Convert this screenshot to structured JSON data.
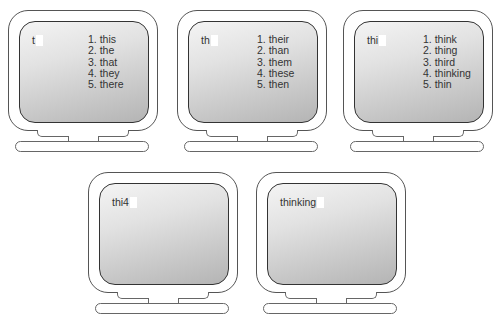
{
  "monitors": [
    {
      "typed": "t",
      "suggestions": [
        "1. this",
        "2. the",
        "3. that",
        "4. they",
        "5. there"
      ]
    },
    {
      "typed": "th",
      "suggestions": [
        "1. their",
        "2. than",
        "3. them",
        "4. these",
        "5. then"
      ]
    },
    {
      "typed": "thi",
      "suggestions": [
        "1. think",
        "2. thing",
        "3. third",
        "4. thinking",
        "5. thin"
      ]
    },
    {
      "typed": "thi4",
      "suggestions": []
    },
    {
      "typed": "thinking",
      "suggestions": []
    }
  ]
}
